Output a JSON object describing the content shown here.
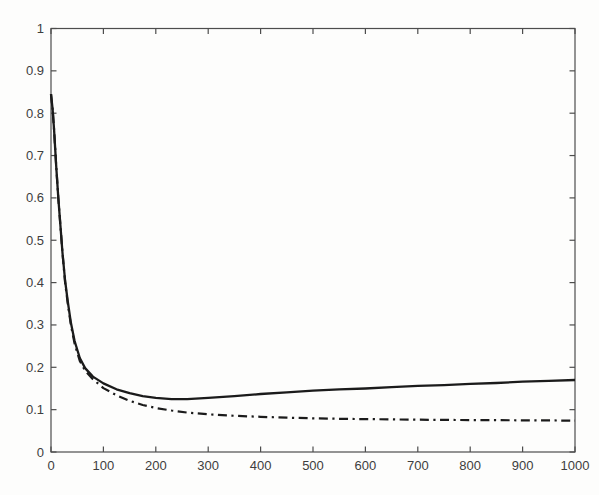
{
  "figure": {
    "background": "#fdfdfc",
    "title": "",
    "legend": null
  },
  "chart_data": {
    "type": "line",
    "title": "",
    "xlabel": "",
    "ylabel": "",
    "xlim": [
      0,
      1000
    ],
    "ylim": [
      0,
      1
    ],
    "xticks": [
      0,
      100,
      200,
      300,
      400,
      500,
      600,
      700,
      800,
      900,
      1000
    ],
    "yticks": [
      0,
      0.1,
      0.2,
      0.3,
      0.4,
      0.5,
      0.6,
      0.7,
      0.8,
      0.9,
      1
    ],
    "grid": false,
    "box": true,
    "legend_position": "none",
    "axis_color": "#4d4d4d",
    "line_color": "#1b1b1b",
    "plot_area": {
      "left": 51,
      "top": 28.5,
      "right": 575,
      "bottom": 452
    },
    "series": [
      {
        "name": "solid-curve",
        "style": "solid",
        "dash": "",
        "width": 2.3,
        "x": [
          0,
          3,
          6,
          10,
          14,
          18,
          22,
          27,
          32,
          38,
          45,
          55,
          65,
          80,
          100,
          125,
          150,
          175,
          200,
          230,
          260,
          300,
          350,
          400,
          450,
          500,
          550,
          600,
          650,
          700,
          750,
          800,
          850,
          900,
          950,
          1000
        ],
        "y": [
          0.845,
          0.81,
          0.76,
          0.675,
          0.6,
          0.535,
          0.47,
          0.405,
          0.355,
          0.305,
          0.262,
          0.222,
          0.198,
          0.178,
          0.162,
          0.148,
          0.139,
          0.132,
          0.128,
          0.125,
          0.125,
          0.128,
          0.132,
          0.137,
          0.141,
          0.145,
          0.148,
          0.15,
          0.153,
          0.156,
          0.158,
          0.161,
          0.163,
          0.166,
          0.168,
          0.17
        ]
      },
      {
        "name": "dashdot-curve",
        "style": "dash-dot",
        "dash": "9 4.5 2.2 4.5",
        "width": 2.2,
        "x": [
          0,
          3,
          6,
          10,
          14,
          18,
          22,
          27,
          32,
          38,
          45,
          55,
          65,
          80,
          100,
          125,
          150,
          175,
          200,
          230,
          260,
          300,
          350,
          400,
          450,
          500,
          550,
          600,
          650,
          700,
          750,
          800,
          850,
          900,
          950,
          1000
        ],
        "y": [
          0.845,
          0.81,
          0.76,
          0.675,
          0.6,
          0.535,
          0.47,
          0.4,
          0.35,
          0.3,
          0.256,
          0.215,
          0.192,
          0.172,
          0.151,
          0.134,
          0.121,
          0.111,
          0.104,
          0.098,
          0.093,
          0.089,
          0.0855,
          0.083,
          0.081,
          0.0795,
          0.0785,
          0.0777,
          0.077,
          0.0763,
          0.0758,
          0.0754,
          0.0751,
          0.0748,
          0.0746,
          0.074
        ]
      }
    ]
  }
}
